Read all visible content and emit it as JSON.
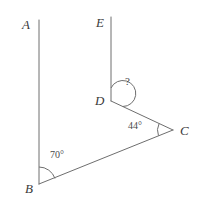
{
  "figure": {
    "type": "geometry-diagram",
    "background_color": "#ffffff",
    "stroke_color": "#6e6e6e",
    "text_color": "#3a3a3a",
    "width": 206,
    "height": 208
  },
  "points": {
    "A": {
      "label": "A",
      "x": 39,
      "y": 20
    },
    "B": {
      "label": "B",
      "x": 39,
      "y": 184
    },
    "C": {
      "label": "C",
      "x": 173,
      "y": 130
    },
    "D": {
      "label": "D",
      "x": 111,
      "y": 101
    },
    "E": {
      "label": "E",
      "x": 111,
      "y": 17
    }
  },
  "segments": [
    {
      "name": "segment-AB",
      "from": "A",
      "to": "B"
    },
    {
      "name": "segment-ED",
      "from": "E",
      "to": "D"
    },
    {
      "name": "segment-BC",
      "from": "B",
      "to": "C"
    },
    {
      "name": "segment-DC",
      "from": "D",
      "to": "C"
    }
  ],
  "angles": [
    {
      "name": "angle-at-B",
      "vertex": "B",
      "label": "70°",
      "value": 70,
      "known": true,
      "arc_radius": 17
    },
    {
      "name": "angle-at-C",
      "vertex": "C",
      "label": "44°",
      "value": 44,
      "known": true,
      "arc_radius": 15
    },
    {
      "name": "angle-at-D",
      "vertex": "D",
      "label": "?",
      "value": null,
      "known": false,
      "arc_radius": 13
    }
  ],
  "labels": {
    "A": "A",
    "B": "B",
    "C": "C",
    "D": "D",
    "E": "E",
    "angle_b": "70°",
    "angle_c": "44°",
    "angle_d": "?"
  }
}
